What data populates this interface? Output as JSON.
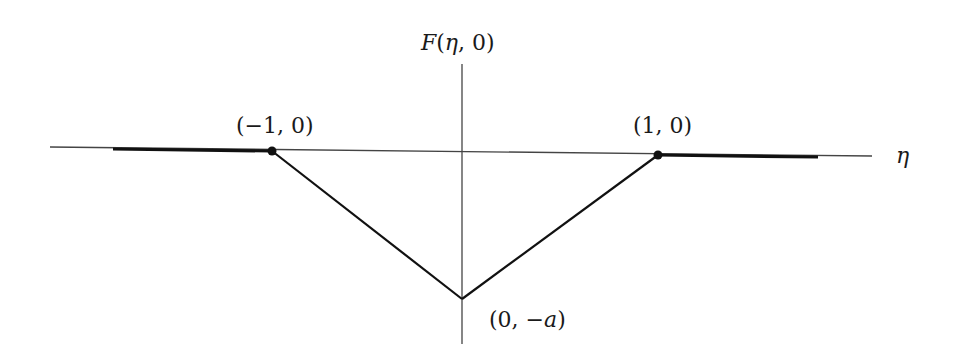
{
  "diagram": {
    "title_label": "F(η, 0)",
    "y_axis_label": {
      "func": "F",
      "open": "(",
      "var": "η",
      "sep": ", ",
      "val": "0",
      "close": ")"
    },
    "x_axis_label": "η",
    "points": [
      {
        "id": "left",
        "label": "(−1, 0)",
        "x": -1,
        "y": 0
      },
      {
        "id": "right",
        "label": "(1, 0)",
        "x": 1,
        "y": 0
      },
      {
        "id": "vertex",
        "label_open": "(0, −",
        "label_var": "a",
        "label_close": ")",
        "x": 0,
        "y": "-a"
      }
    ],
    "labels": {
      "left_point": "(−1, 0)",
      "right_point": "(1, 0)",
      "vertex_prefix": "(0, −",
      "vertex_var": "a",
      "vertex_suffix": ")"
    },
    "colors": {
      "line": "#111111",
      "axis": "#333333"
    }
  }
}
